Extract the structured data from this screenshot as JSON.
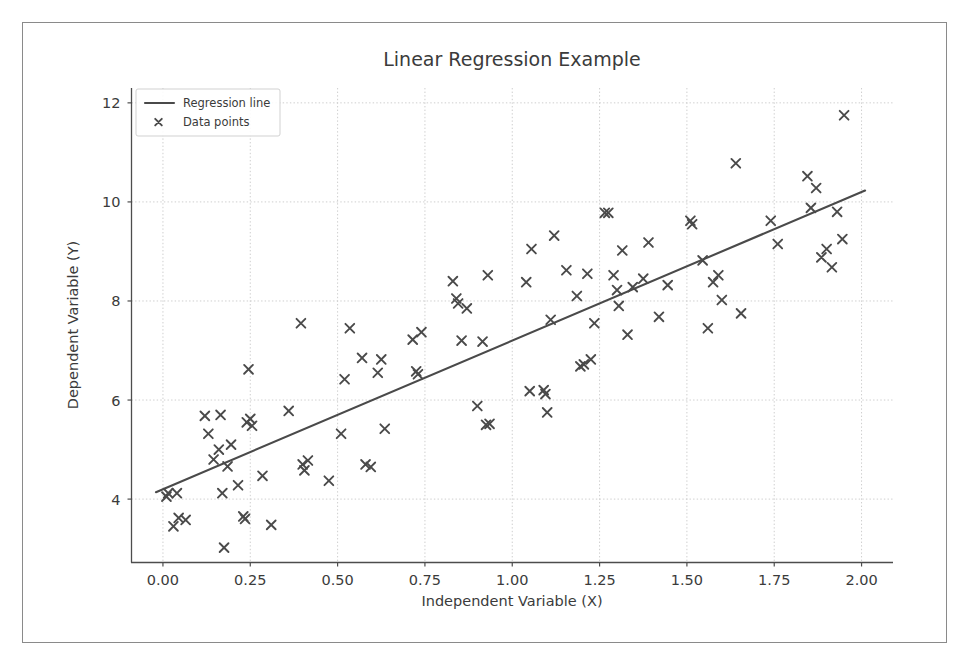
{
  "figure": {
    "background": "#ffffff",
    "frame_color": "#8a8a8a",
    "accent": "#4a4a4a"
  },
  "chart_data": {
    "type": "scatter",
    "title": "Linear Regression Example",
    "xlabel": "Independent Variable (X)",
    "ylabel": "Dependent Variable (Y)",
    "xlim": [
      -0.09,
      2.09
    ],
    "ylim": [
      2.72,
      12.3
    ],
    "xticks": [
      0.0,
      0.25,
      0.5,
      0.75,
      1.0,
      1.25,
      1.5,
      1.75,
      2.0
    ],
    "xticklabels": [
      "0.00",
      "0.25",
      "0.50",
      "0.75",
      "1.00",
      "1.25",
      "1.50",
      "1.75",
      "2.00"
    ],
    "yticks": [
      4,
      6,
      8,
      10,
      12
    ],
    "yticklabels": [
      "4",
      "6",
      "8",
      "10",
      "12"
    ],
    "grid": true,
    "grid_style": "dotted",
    "legend_position": "upper left",
    "legend": [
      {
        "label": "Regression line",
        "marker": "line",
        "color": "#4a4a4a"
      },
      {
        "label": "Data points",
        "marker": "x",
        "color": "#4a4a4a"
      }
    ],
    "series": [
      {
        "name": "Regression line",
        "type": "line",
        "color": "#4a4a4a",
        "slope": 3.0,
        "intercept": 4.2,
        "x": [
          -0.02,
          2.01
        ],
        "y": [
          4.14,
          10.23
        ]
      },
      {
        "name": "Data points",
        "type": "scatter",
        "marker": "x",
        "color": "#4a4a4a",
        "points": [
          [
            0.01,
            4.05
          ],
          [
            0.015,
            4.12
          ],
          [
            0.03,
            3.45
          ],
          [
            0.04,
            4.12
          ],
          [
            0.045,
            3.62
          ],
          [
            0.065,
            3.58
          ],
          [
            0.12,
            5.68
          ],
          [
            0.13,
            5.32
          ],
          [
            0.145,
            4.8
          ],
          [
            0.16,
            5.0
          ],
          [
            0.165,
            5.7
          ],
          [
            0.17,
            4.12
          ],
          [
            0.175,
            3.02
          ],
          [
            0.185,
            4.66
          ],
          [
            0.195,
            5.1
          ],
          [
            0.215,
            4.28
          ],
          [
            0.23,
            3.65
          ],
          [
            0.235,
            3.6
          ],
          [
            0.24,
            5.55
          ],
          [
            0.245,
            6.62
          ],
          [
            0.25,
            5.62
          ],
          [
            0.255,
            5.48
          ],
          [
            0.285,
            4.47
          ],
          [
            0.31,
            3.48
          ],
          [
            0.36,
            5.78
          ],
          [
            0.395,
            7.55
          ],
          [
            0.4,
            4.7
          ],
          [
            0.405,
            4.58
          ],
          [
            0.415,
            4.78
          ],
          [
            0.475,
            4.37
          ],
          [
            0.51,
            5.32
          ],
          [
            0.52,
            6.42
          ],
          [
            0.535,
            7.45
          ],
          [
            0.57,
            6.85
          ],
          [
            0.58,
            4.7
          ],
          [
            0.595,
            4.65
          ],
          [
            0.615,
            6.55
          ],
          [
            0.625,
            6.82
          ],
          [
            0.635,
            5.42
          ],
          [
            0.715,
            7.22
          ],
          [
            0.725,
            6.58
          ],
          [
            0.73,
            6.52
          ],
          [
            0.74,
            7.37
          ],
          [
            0.83,
            8.4
          ],
          [
            0.84,
            8.05
          ],
          [
            0.845,
            7.95
          ],
          [
            0.855,
            7.2
          ],
          [
            0.87,
            7.85
          ],
          [
            0.915,
            7.18
          ],
          [
            0.93,
            8.52
          ],
          [
            0.935,
            5.52
          ],
          [
            0.9,
            5.88
          ],
          [
            0.925,
            5.5
          ],
          [
            1.04,
            8.38
          ],
          [
            1.055,
            9.05
          ],
          [
            1.05,
            6.18
          ],
          [
            1.09,
            6.2
          ],
          [
            1.095,
            6.12
          ],
          [
            1.1,
            5.75
          ],
          [
            1.11,
            7.62
          ],
          [
            1.12,
            9.32
          ],
          [
            1.155,
            8.62
          ],
          [
            1.185,
            8.1
          ],
          [
            1.195,
            6.68
          ],
          [
            1.205,
            6.72
          ],
          [
            1.215,
            8.55
          ],
          [
            1.225,
            6.82
          ],
          [
            1.235,
            7.55
          ],
          [
            1.265,
            9.78
          ],
          [
            1.275,
            9.78
          ],
          [
            1.29,
            8.52
          ],
          [
            1.3,
            8.22
          ],
          [
            1.305,
            7.9
          ],
          [
            1.315,
            9.02
          ],
          [
            1.33,
            7.32
          ],
          [
            1.345,
            8.28
          ],
          [
            1.375,
            8.45
          ],
          [
            1.39,
            9.18
          ],
          [
            1.42,
            7.68
          ],
          [
            1.445,
            8.32
          ],
          [
            1.51,
            9.62
          ],
          [
            1.515,
            9.55
          ],
          [
            1.545,
            8.82
          ],
          [
            1.56,
            7.45
          ],
          [
            1.575,
            8.38
          ],
          [
            1.59,
            8.52
          ],
          [
            1.6,
            8.02
          ],
          [
            1.64,
            10.78
          ],
          [
            1.655,
            7.75
          ],
          [
            1.74,
            9.62
          ],
          [
            1.76,
            9.15
          ],
          [
            1.845,
            10.52
          ],
          [
            1.855,
            9.88
          ],
          [
            1.87,
            10.28
          ],
          [
            1.885,
            8.88
          ],
          [
            1.9,
            9.05
          ],
          [
            1.915,
            8.68
          ],
          [
            1.93,
            9.8
          ],
          [
            1.945,
            9.25
          ],
          [
            1.95,
            11.75
          ]
        ]
      }
    ]
  }
}
